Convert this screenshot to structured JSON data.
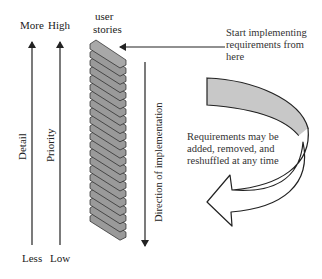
{
  "diagram": {
    "axes": {
      "detail": {
        "label": "Detail",
        "top": "More",
        "bottom": "Less"
      },
      "priority": {
        "label": "Priority",
        "top": "High",
        "bottom": "Low"
      }
    },
    "stack": {
      "label_line1": "user",
      "label_line2": "stories",
      "slab_count": 22
    },
    "start_note": {
      "line1": "Start implementing",
      "line2": "requirements from",
      "line3": "here"
    },
    "direction": {
      "label": "Direction of implementation"
    },
    "reshuffle_note": {
      "line1": "Requirements may be",
      "line2": "added, removed, and",
      "line3": "reshuffled at any time"
    },
    "colors": {
      "stroke": "#222222",
      "slab_fill": "#9a9a9a",
      "band_fill": "#c8c8c8",
      "background": "#ffffff"
    }
  }
}
